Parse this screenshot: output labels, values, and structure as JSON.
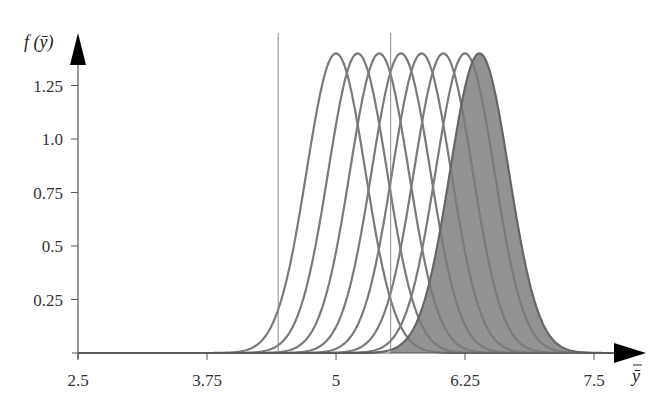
{
  "chart_data": {
    "type": "line",
    "title": "",
    "xlabel": "ȳ",
    "ylabel": "f (ȳ)",
    "xlim": [
      2.5,
      7.8
    ],
    "ylim": [
      0,
      1.5
    ],
    "grid": false,
    "legend": null,
    "x_ticks": [
      {
        "value": 2.5,
        "label": "2.5"
      },
      {
        "value": 3.75,
        "label": "3.75"
      },
      {
        "value": 5,
        "label": "5"
      },
      {
        "value": 6.25,
        "label": "6.25"
      },
      {
        "value": 7.5,
        "label": "7.5"
      }
    ],
    "y_ticks": [
      {
        "value": 0.25,
        "label": "0.25"
      },
      {
        "value": 0.5,
        "label": "0.5"
      },
      {
        "value": 0.75,
        "label": "0.75"
      },
      {
        "value": 1.0,
        "label": "1.0"
      },
      {
        "value": 1.25,
        "label": "1.25"
      }
    ],
    "curve_description": "Normal density curves of sample mean with identical spread, shifted means",
    "sd": 0.285,
    "peak_height": 1.4,
    "series": [
      {
        "name": "mean 5.00",
        "mean": 5.0,
        "shaded": false
      },
      {
        "name": "mean 5.21",
        "mean": 5.21,
        "shaded": false
      },
      {
        "name": "mean 5.42",
        "mean": 5.42,
        "shaded": false
      },
      {
        "name": "mean 5.63",
        "mean": 5.63,
        "shaded": false
      },
      {
        "name": "mean 5.83",
        "mean": 5.83,
        "shaded": false
      },
      {
        "name": "mean 6.04",
        "mean": 6.04,
        "shaded": false
      },
      {
        "name": "mean 6.25",
        "mean": 6.25,
        "shaded": false
      },
      {
        "name": "mean 6.39",
        "mean": 6.39,
        "shaded": true
      }
    ],
    "shaded_region": {
      "from": 5.53,
      "to": 7.8,
      "curve": "mean 6.39"
    },
    "vertical_lines": [
      4.44,
      5.53
    ],
    "colors": {
      "curve": "#7a7a7a",
      "fill": "#8c8c8c",
      "axis": "#555555",
      "vline": "#888888"
    }
  },
  "labels": {
    "y_axis_title": "f (ȳ)",
    "x_axis_title": "ȳ"
  }
}
